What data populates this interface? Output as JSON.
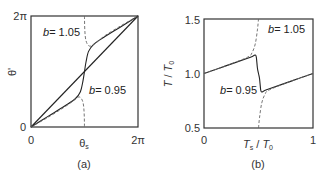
{
  "chart_data": [
    {
      "type": "line",
      "panel_label": "(a)",
      "xlabel": "θs",
      "ylabel": "θ'",
      "xlim": [
        0,
        6.2832
      ],
      "ylim": [
        0,
        6.2832
      ],
      "xticks": [
        {
          "value": 0,
          "label": "0"
        },
        {
          "value": 6.2832,
          "label": "2π"
        }
      ],
      "yticks": [
        {
          "value": 0,
          "label": "0"
        },
        {
          "value": 6.2832,
          "label": "2π"
        }
      ],
      "annotations": [
        {
          "text_b": "b",
          "text_val": "= 1.05",
          "at": [
            2.0,
            5.4
          ]
        },
        {
          "text_b": "b",
          "text_val": "= 0.95",
          "at": [
            4.1,
            2.3
          ]
        }
      ],
      "series": [
        {
          "name": "diagonal",
          "style": "solid",
          "x": [
            0,
            6.2832
          ],
          "y": [
            0,
            6.2832
          ]
        },
        {
          "name": "b = 0.95",
          "style": "solid",
          "x": [
            0,
            1.0,
            2.0,
            2.6,
            2.9,
            3.05,
            3.1416,
            3.23,
            3.38,
            3.68,
            4.28,
            5.28,
            6.2832
          ],
          "y": [
            0,
            0.6,
            1.2,
            1.6,
            2.0,
            2.6,
            3.1416,
            3.68,
            4.28,
            4.68,
            5.08,
            5.68,
            6.2832
          ]
        },
        {
          "name": "b = 1.05 lower",
          "style": "dashed",
          "x": [
            0,
            1.0,
            2.0,
            2.5,
            2.85,
            3.05,
            3.12,
            3.14
          ],
          "y": [
            0,
            0.55,
            1.15,
            1.5,
            1.7,
            1.4,
            0.8,
            0
          ]
        },
        {
          "name": "b = 1.05 upper",
          "style": "dashed",
          "x": [
            3.14,
            3.16,
            3.23,
            3.43,
            3.78,
            4.28,
            5.28,
            6.2832
          ],
          "y": [
            6.2832,
            5.48,
            4.88,
            4.58,
            4.73,
            5.13,
            5.73,
            6.2832
          ]
        }
      ]
    },
    {
      "type": "line",
      "panel_label": "(b)",
      "xlabel_main": "T",
      "xlabel_sub": "s",
      "xlabel_den": "T",
      "xlabel_den_sub": "0",
      "ylabel": "T / T0",
      "xlim": [
        0,
        1
      ],
      "ylim": [
        0.5,
        1.5
      ],
      "xticks": [
        {
          "value": 0,
          "label": "0"
        },
        {
          "value": 1,
          "label": "1"
        }
      ],
      "yticks": [
        {
          "value": 0.5,
          "label": "0.5"
        },
        {
          "value": 1.0,
          "label": "1.0"
        },
        {
          "value": 1.5,
          "label": "1.5"
        }
      ],
      "annotations": [
        {
          "text_b": "b",
          "text_val": "= 1.05",
          "at": [
            0.6,
            1.42
          ]
        },
        {
          "text_b": "b",
          "text_val": "= 0.95",
          "at": [
            0.16,
            0.86
          ]
        }
      ],
      "series": [
        {
          "name": "b = 0.95",
          "style": "solid",
          "x": [
            0,
            0.2,
            0.4,
            0.45,
            0.47,
            0.48,
            0.49,
            0.5,
            0.51,
            0.52,
            0.53,
            0.55,
            0.6,
            0.8,
            1.0
          ],
          "y": [
            1.0,
            1.07,
            1.14,
            1.16,
            1.17,
            1.15,
            1.05,
            1.0,
            0.95,
            0.85,
            0.83,
            0.84,
            0.86,
            0.93,
            1.0
          ]
        },
        {
          "name": "b = 1.05 lower branch",
          "style": "dashed",
          "x": [
            0,
            0.2,
            0.4,
            0.44,
            0.47,
            0.49,
            0.5
          ],
          "y": [
            1.0,
            1.07,
            1.15,
            1.19,
            1.27,
            1.4,
            1.5
          ]
        },
        {
          "name": "b = 1.05 upper branch",
          "style": "dashed",
          "x": [
            0.5,
            0.51,
            0.53,
            0.56,
            0.6,
            0.8,
            1.0
          ],
          "y": [
            0.5,
            0.6,
            0.73,
            0.81,
            0.85,
            0.93,
            1.0
          ]
        }
      ]
    }
  ]
}
